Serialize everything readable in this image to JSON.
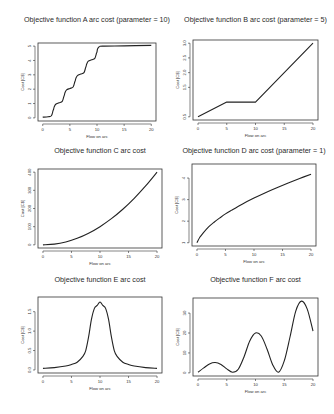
{
  "chart_data": [
    {
      "id": "A",
      "type": "line",
      "title": "Objective function A arc cost (parameter = 10)",
      "xlabel": "Flow on arc",
      "ylabel": "Cost [C$]",
      "xlim": [
        0,
        20
      ],
      "ylim": [
        0,
        5
      ],
      "xticks": [
        0,
        5,
        10,
        15,
        20
      ],
      "yticks": [
        0,
        1,
        2,
        3,
        4,
        5
      ],
      "grid": false,
      "description": "staircase: steps of 1 at flow 2,4,6,8,10; flat at ~5 after 10",
      "x": [
        0,
        1,
        1.6,
        1.9,
        2.0,
        2.1,
        2.4,
        3,
        3.6,
        3.9,
        4.0,
        4.1,
        4.4,
        5,
        5.6,
        5.9,
        6.0,
        6.1,
        6.4,
        7,
        7.6,
        7.9,
        8.0,
        8.1,
        8.4,
        9,
        9.6,
        9.9,
        10.0,
        10.1,
        10.4,
        11,
        15,
        20
      ],
      "y": [
        0.05,
        0.08,
        0.15,
        0.5,
        0.6,
        0.75,
        0.95,
        1.05,
        1.15,
        1.5,
        1.6,
        1.75,
        1.95,
        2.05,
        2.15,
        2.5,
        2.6,
        2.75,
        2.95,
        3.05,
        3.15,
        3.5,
        3.6,
        3.75,
        3.95,
        4.05,
        4.15,
        4.5,
        4.6,
        4.8,
        4.95,
        5.0,
        5.02,
        5.05
      ]
    },
    {
      "id": "B",
      "type": "line",
      "title": "Objective function B arc cost (parameter = 5)",
      "xlabel": "Flow on arc",
      "ylabel": "Cost [C$]",
      "xlim": [
        0,
        20
      ],
      "ylim": [
        0.5,
        3.0
      ],
      "xticks": [
        0,
        5,
        10,
        15,
        20
      ],
      "yticks": [
        0.5,
        1.5,
        2.0,
        2.5,
        3.0
      ],
      "ytick_labels": [
        "0.5",
        "1.5",
        "2.0",
        "2.5",
        "3.0"
      ],
      "grid": false,
      "x": [
        0,
        5,
        10,
        20
      ],
      "y": [
        0.5,
        1.0,
        1.0,
        3.0
      ]
    },
    {
      "id": "C",
      "type": "line",
      "title": "Objective function C arc cost",
      "xlabel": "Flow on arc",
      "ylabel": "Cost [C$]",
      "xlim": [
        0,
        20
      ],
      "ylim": [
        0,
        400
      ],
      "xticks": [
        0,
        5,
        10,
        15,
        20
      ],
      "yticks": [
        0,
        100,
        200,
        300,
        400
      ],
      "grid": false,
      "x": [
        0,
        2,
        4,
        6,
        8,
        10,
        12,
        14,
        16,
        18,
        20
      ],
      "y": [
        0,
        4,
        16,
        36,
        64,
        100,
        144,
        196,
        256,
        324,
        400
      ]
    },
    {
      "id": "D",
      "type": "line",
      "title": "Objective function D arc cost (parameter = 1)",
      "xlabel": "Flow on arc",
      "ylabel": "Cost [C$]",
      "xlim": [
        0,
        20
      ],
      "ylim": [
        1,
        4.5
      ],
      "xticks": [
        0,
        5,
        10,
        15,
        20
      ],
      "yticks": [
        1,
        2,
        3,
        4
      ],
      "grid": false,
      "x": [
        0,
        0.5,
        1,
        2,
        3,
        4,
        5,
        6,
        8,
        10,
        12,
        14,
        16,
        18,
        20
      ],
      "y": [
        1.0,
        1.25,
        1.42,
        1.72,
        1.95,
        2.15,
        2.34,
        2.5,
        2.8,
        3.07,
        3.32,
        3.55,
        3.77,
        3.98,
        4.18
      ]
    },
    {
      "id": "E",
      "type": "line",
      "title": "Objective function E arc cost",
      "xlabel": "Flow on arc",
      "ylabel": "Cost [C$]",
      "xlim": [
        0,
        20
      ],
      "ylim": [
        0,
        1.8
      ],
      "xticks": [
        0,
        5,
        10,
        15,
        20
      ],
      "yticks": [
        0.0,
        0.5,
        1.0,
        1.5
      ],
      "ytick_labels": [
        "0.0",
        "0.5",
        "1.0",
        "1.5"
      ],
      "grid": false,
      "x": [
        0,
        2,
        4,
        5,
        6,
        7,
        7.5,
        8,
        8.5,
        9,
        9.5,
        10,
        10.5,
        11,
        11.5,
        12,
        12.5,
        13,
        14,
        15,
        16,
        18,
        20
      ],
      "y": [
        0.04,
        0.06,
        0.1,
        0.14,
        0.2,
        0.35,
        0.5,
        0.85,
        1.3,
        1.58,
        1.66,
        1.75,
        1.66,
        1.58,
        1.3,
        0.85,
        0.5,
        0.35,
        0.2,
        0.14,
        0.1,
        0.06,
        0.04
      ]
    },
    {
      "id": "F",
      "type": "line",
      "title": "Objective function F arc cost",
      "xlabel": "Flow on arc",
      "ylabel": "Cost [C$]",
      "xlim": [
        0,
        20
      ],
      "ylim": [
        0,
        36
      ],
      "xticks": [
        0,
        5,
        10,
        15,
        20
      ],
      "yticks": [
        0,
        10,
        20,
        30
      ],
      "grid": false,
      "x": [
        0,
        1,
        2,
        3,
        4,
        5,
        6,
        7,
        8,
        9,
        10,
        11,
        12,
        13,
        14,
        15,
        16,
        17,
        18,
        19,
        20
      ],
      "y": [
        0.3,
        2.5,
        4.5,
        5.2,
        4.2,
        2.0,
        0.3,
        1.8,
        8,
        16,
        20,
        18.5,
        12,
        4,
        0.3,
        6,
        18,
        31,
        36,
        32,
        21
      ]
    }
  ]
}
